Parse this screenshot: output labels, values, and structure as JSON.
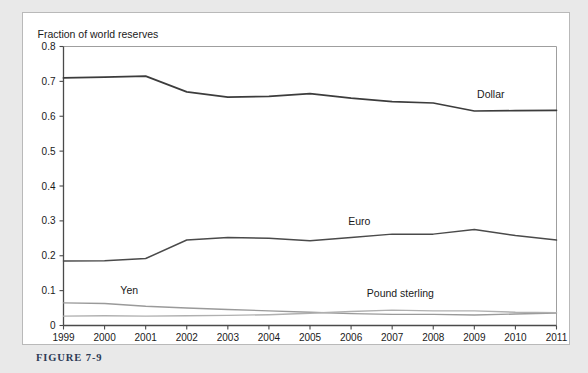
{
  "caption": "FIGURE 7-9",
  "colors": {
    "page_background": "#e9e9e9",
    "card_background": "#ffffff",
    "card_border": "#b9b9b9",
    "axis": "#4a4a4a",
    "dollar": "#3c3c3c",
    "euro": "#4a4a4a",
    "yen": "#9a9a9a",
    "pound": "#b0b0b0",
    "caption_text": "#2d3b56"
  },
  "chart_data": {
    "type": "line",
    "title": "Fraction of world reserves",
    "xlabel": "",
    "ylabel": "",
    "grid": false,
    "legend_position": "inline-annotations",
    "x": [
      1999,
      2000,
      2001,
      2002,
      2003,
      2004,
      2005,
      2006,
      2007,
      2008,
      2009,
      2010,
      2011
    ],
    "xtick_labels": [
      "1999",
      "2000",
      "2001",
      "2002",
      "2003",
      "2004",
      "2005",
      "2006",
      "2007",
      "2008",
      "2009",
      "2010",
      "2011"
    ],
    "xlim": [
      1999,
      2011
    ],
    "ylim": [
      0,
      0.8
    ],
    "ytick_labels": [
      "0",
      "0.1",
      "0.2",
      "0.3",
      "0.4",
      "0.5",
      "0.6",
      "0.7",
      "0.8"
    ],
    "yticks": [
      0,
      0.1,
      0.2,
      0.3,
      0.4,
      0.5,
      0.6,
      0.7,
      0.8
    ],
    "series": [
      {
        "name": "Dollar",
        "label": "Dollar",
        "values": [
          0.71,
          0.712,
          0.715,
          0.67,
          0.655,
          0.657,
          0.665,
          0.652,
          0.642,
          0.638,
          0.615,
          0.616,
          0.617
        ]
      },
      {
        "name": "Euro",
        "label": "Euro",
        "values": [
          0.185,
          0.186,
          0.192,
          0.245,
          0.252,
          0.25,
          0.243,
          0.252,
          0.262,
          0.262,
          0.275,
          0.258,
          0.245
        ]
      },
      {
        "name": "Yen",
        "label": "Yen",
        "values": [
          0.065,
          0.063,
          0.055,
          0.05,
          0.046,
          0.042,
          0.038,
          0.034,
          0.032,
          0.032,
          0.03,
          0.033,
          0.036
        ]
      },
      {
        "name": "Pound sterling",
        "label": "Pound sterling",
        "values": [
          0.027,
          0.028,
          0.027,
          0.028,
          0.029,
          0.031,
          0.035,
          0.04,
          0.044,
          0.042,
          0.042,
          0.038,
          0.037
        ]
      }
    ]
  }
}
